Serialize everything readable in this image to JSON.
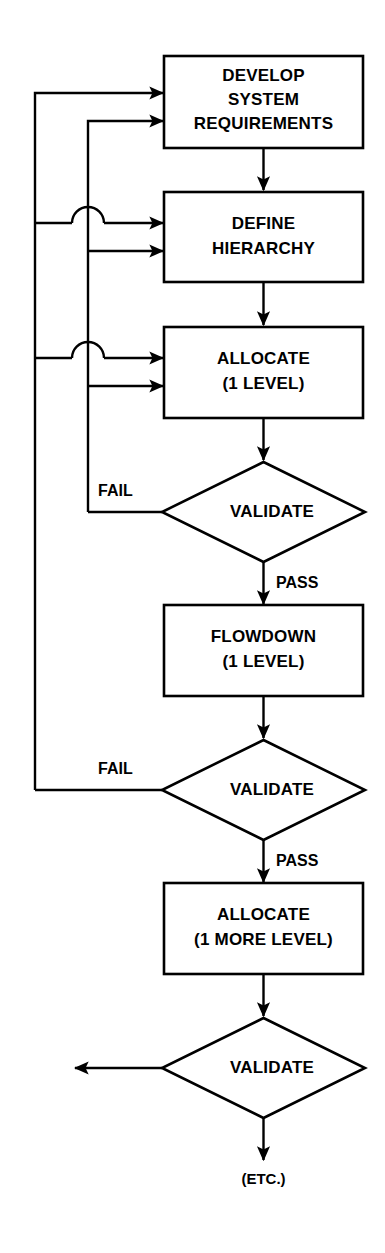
{
  "diagram": {
    "orientation": "top-to-bottom",
    "stroke_color": "#000000",
    "fill_color": "#ffffff",
    "background": "#ffffff",
    "nodes": [
      {
        "id": "develop",
        "shape": "process",
        "lines": [
          "DEVELOP",
          "SYSTEM",
          "REQUIREMENTS"
        ]
      },
      {
        "id": "define",
        "shape": "process",
        "lines": [
          "DEFINE",
          "HIERARCHY"
        ]
      },
      {
        "id": "allocate1",
        "shape": "process",
        "lines": [
          "ALLOCATE",
          "(1 LEVEL)"
        ]
      },
      {
        "id": "validate1",
        "shape": "decision",
        "lines": [
          "VALIDATE"
        ]
      },
      {
        "id": "flowdown",
        "shape": "process",
        "lines": [
          "FLOWDOWN",
          "(1 LEVEL)"
        ]
      },
      {
        "id": "validate2",
        "shape": "decision",
        "lines": [
          "VALIDATE"
        ]
      },
      {
        "id": "allocate2",
        "shape": "process",
        "lines": [
          "ALLOCATE",
          "(1 MORE LEVEL)"
        ]
      },
      {
        "id": "validate3",
        "shape": "decision",
        "lines": [
          "VALIDATE"
        ]
      },
      {
        "id": "etc",
        "shape": "terminal",
        "lines": [
          "(ETC.)"
        ]
      }
    ],
    "edge_labels": {
      "fail_1": "FAIL",
      "pass_1": "PASS",
      "fail_2": "FAIL",
      "pass_2": "PASS"
    },
    "edges": [
      {
        "from": "develop",
        "to": "define",
        "label": ""
      },
      {
        "from": "define",
        "to": "allocate1",
        "label": ""
      },
      {
        "from": "allocate1",
        "to": "validate1",
        "label": ""
      },
      {
        "from": "validate1",
        "to": "flowdown",
        "label": "PASS"
      },
      {
        "from": "validate1",
        "to": "define",
        "label": "FAIL"
      },
      {
        "from": "validate1",
        "to": "allocate1",
        "label": "FAIL"
      },
      {
        "from": "validate1",
        "to": "develop",
        "label": "FAIL"
      },
      {
        "from": "flowdown",
        "to": "validate2",
        "label": ""
      },
      {
        "from": "validate2",
        "to": "allocate2",
        "label": "PASS"
      },
      {
        "from": "validate2",
        "to": "develop",
        "label": "FAIL"
      },
      {
        "from": "validate2",
        "to": "define",
        "label": "FAIL"
      },
      {
        "from": "validate2",
        "to": "allocate1",
        "label": "FAIL"
      },
      {
        "from": "allocate2",
        "to": "validate3",
        "label": ""
      },
      {
        "from": "validate3",
        "to": "etc",
        "label": ""
      },
      {
        "from": "validate3",
        "to": "(offpage-left)",
        "label": ""
      }
    ]
  }
}
